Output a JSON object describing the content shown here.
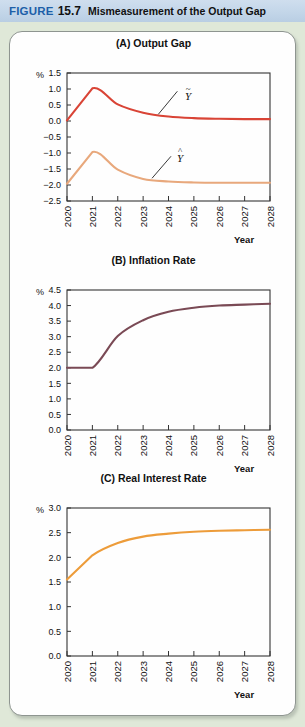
{
  "caption": {
    "figure_word": "FIGURE",
    "figure_number": "15.7",
    "figure_title": "Mismeasurement of the Output Gap"
  },
  "colors": {
    "page_background": "#dfe8d8",
    "caption_background": "#c3d6e9",
    "caption_figure_word": "#1d5fa8",
    "panel_background": "#fefefe",
    "axis": "#333333",
    "output_gap_true": "#d94436",
    "output_gap_estimate": "#e8a87c",
    "inflation": "#7a4a55",
    "real_interest": "#ed9c3a"
  },
  "axis_labels": {
    "percent": "%",
    "year": "Year"
  },
  "curve_labels": {
    "true_output_gap": {
      "accent": "~",
      "base": "Y"
    },
    "estimated_output_gap": {
      "accent": "^",
      "base": "Y"
    }
  },
  "chart_data": [
    {
      "id": "output-gap",
      "type": "line",
      "title": "(A) Output Gap",
      "xlabel": "Year",
      "ylabel": "%",
      "x": [
        2020,
        2021,
        2022,
        2023,
        2024,
        2025,
        2026,
        2027,
        2028
      ],
      "categories": [
        "2020",
        "2021",
        "2022",
        "2023",
        "2024",
        "2025",
        "2026",
        "2027",
        "2028"
      ],
      "ylim": [
        -2.5,
        1.5
      ],
      "yticks": [
        1.5,
        1.0,
        0.5,
        0.0,
        -0.5,
        -1.0,
        -1.5,
        -2.0,
        -2.5
      ],
      "ytick_labels": [
        "1.5",
        "1.0",
        "0.5",
        "0.0",
        "-0.5",
        "-1.0",
        "-1.5",
        "-2.0",
        "-2.5"
      ],
      "grid": false,
      "legend": "inline-annotations",
      "series": [
        {
          "name": "Y-tilde",
          "label": "true output gap",
          "color": "#d94436",
          "values": [
            0.02,
            1.02,
            0.52,
            0.26,
            0.14,
            0.09,
            0.07,
            0.06,
            0.06
          ]
        },
        {
          "name": "Y-hat",
          "label": "measured output gap",
          "color": "#e8a87c",
          "values": [
            -1.96,
            -0.97,
            -1.52,
            -1.81,
            -1.89,
            -1.92,
            -1.93,
            -1.93,
            -1.93
          ]
        }
      ]
    },
    {
      "id": "inflation-rate",
      "type": "line",
      "title": "(B) Inflation Rate",
      "xlabel": "Year",
      "ylabel": "%",
      "x": [
        2020,
        2021,
        2022,
        2023,
        2024,
        2025,
        2026,
        2027,
        2028
      ],
      "categories": [
        "2020",
        "2021",
        "2022",
        "2023",
        "2024",
        "2025",
        "2026",
        "2027",
        "2028"
      ],
      "ylim": [
        0.0,
        4.5
      ],
      "yticks": [
        4.5,
        4.0,
        3.5,
        3.0,
        2.5,
        2.0,
        1.5,
        1.0,
        0.5,
        0.0
      ],
      "ytick_labels": [
        "4.5",
        "4.0",
        "3.5",
        "3.0",
        "2.5",
        "2.0",
        "1.5",
        "1.0",
        "0.5",
        "0.0"
      ],
      "grid": false,
      "series": [
        {
          "name": "Inflation",
          "color": "#7a4a55",
          "values": [
            2.0,
            2.0,
            3.02,
            3.53,
            3.8,
            3.93,
            4.0,
            4.03,
            4.06
          ]
        }
      ]
    },
    {
      "id": "real-interest-rate",
      "type": "line",
      "title": "(C) Real Interest Rate",
      "xlabel": "Year",
      "ylabel": "%",
      "x": [
        2020,
        2021,
        2022,
        2023,
        2024,
        2025,
        2026,
        2027,
        2028
      ],
      "categories": [
        "2020",
        "2021",
        "2022",
        "2023",
        "2024",
        "2025",
        "2026",
        "2027",
        "2028"
      ],
      "ylim": [
        0.0,
        3.0
      ],
      "yticks": [
        3.0,
        2.5,
        2.0,
        1.5,
        1.0,
        0.5,
        0.0
      ],
      "ytick_labels": [
        "3.0",
        "2.5",
        "2.0",
        "1.5",
        "1.0",
        "0.5",
        "0.0"
      ],
      "grid": false,
      "series": [
        {
          "name": "Real interest rate",
          "color": "#ed9c3a",
          "values": [
            1.55,
            2.04,
            2.29,
            2.42,
            2.48,
            2.52,
            2.54,
            2.55,
            2.56
          ]
        }
      ]
    }
  ]
}
